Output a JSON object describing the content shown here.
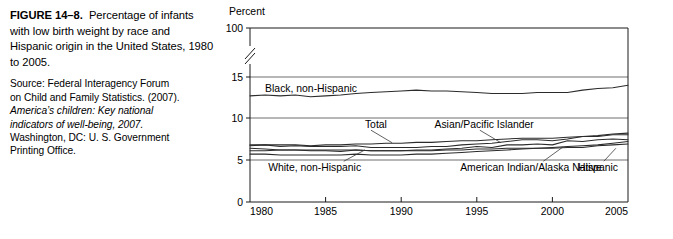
{
  "caption": {
    "figure_label": "FIGURE 14–8.",
    "title_text": "Percentage of infants with low birth weight by race and Hispanic origin in the United States, 1980 to 2005.",
    "source_line1": "Source: Federal Interagency Forum",
    "source_line2": "on Child and  Family Statistics. (2007).",
    "source_italic1": "America’s children: Key national",
    "source_italic2": "indicators of well-being, 2007.",
    "source_line3": "Washington, DC: U. S. Government",
    "source_line4": "Printing Office."
  },
  "chart_data": {
    "type": "line",
    "title": "",
    "xlabel": "",
    "ylabel": "Percent",
    "xlim": [
      1980,
      2005
    ],
    "ylim": [
      0,
      100
    ],
    "y_axis_break": {
      "between": [
        15,
        100
      ],
      "marker": "double-slash"
    },
    "grid": true,
    "legend": "inline-labels",
    "x_ticks": [
      1980,
      1985,
      1990,
      1995,
      2000,
      2005
    ],
    "x_tick_labels": [
      "1980",
      "1985",
      "1990",
      "1995",
      "2000",
      "2005"
    ],
    "y_ticks": [
      0,
      5,
      10,
      15,
      100
    ],
    "y_tick_labels": [
      "0",
      "5",
      "10",
      "15",
      "100"
    ],
    "x": [
      1980,
      1981,
      1982,
      1983,
      1984,
      1985,
      1986,
      1987,
      1988,
      1989,
      1990,
      1991,
      1992,
      1993,
      1994,
      1995,
      1996,
      1997,
      1998,
      1999,
      2000,
      2001,
      2002,
      2003,
      2004,
      2005
    ],
    "series": [
      {
        "name": "Black, non-Hispanic",
        "label": "Black, non-Hispanic",
        "label_x": 1981.0,
        "label_y": 13.6,
        "values": [
          12.7,
          12.8,
          12.7,
          12.8,
          12.6,
          12.7,
          12.8,
          13.0,
          13.1,
          13.2,
          13.3,
          13.4,
          13.3,
          13.3,
          13.2,
          13.1,
          13.0,
          13.0,
          13.0,
          13.1,
          13.1,
          13.1,
          13.4,
          13.6,
          13.7,
          14.0
        ]
      },
      {
        "name": "Total",
        "label": "Total",
        "label_x": 1987.6,
        "label_y": 9.2,
        "leader": {
          "x1": 1988.0,
          "y1": 8.55,
          "x2": 1989.4,
          "y2": 7.05
        },
        "values": [
          6.8,
          6.8,
          6.8,
          6.8,
          6.7,
          6.8,
          6.8,
          6.9,
          6.9,
          7.0,
          7.0,
          7.1,
          7.1,
          7.2,
          7.3,
          7.3,
          7.4,
          7.5,
          7.6,
          7.6,
          7.6,
          7.7,
          7.8,
          7.9,
          8.1,
          8.2
        ]
      },
      {
        "name": "Asian/Pacific Islander",
        "label": "Asian/Pacific Islander",
        "label_x": 1992.2,
        "label_y": 9.2,
        "leader": {
          "x1": 1995.2,
          "y1": 8.55,
          "x2": 1996.6,
          "y2": 7.05
        },
        "values": [
          6.7,
          6.8,
          6.6,
          6.7,
          6.6,
          6.6,
          6.6,
          6.7,
          6.5,
          6.5,
          6.5,
          6.5,
          6.6,
          6.6,
          6.8,
          6.9,
          7.0,
          7.2,
          7.4,
          7.4,
          7.3,
          7.5,
          7.8,
          7.8,
          8.0,
          8.0
        ]
      },
      {
        "name": "American Indian/Alaska Native",
        "label": "American Indian/Alaska Native",
        "label_x": 1993.9,
        "label_y": 4.15,
        "leader": {
          "x1": 1999.4,
          "y1": 4.85,
          "x2": 2000.7,
          "y2": 6.55
        },
        "values": [
          6.4,
          6.3,
          6.2,
          6.2,
          6.1,
          6.1,
          6.0,
          6.2,
          6.1,
          6.1,
          6.1,
          6.2,
          6.2,
          6.3,
          6.4,
          6.6,
          6.5,
          6.8,
          6.8,
          6.9,
          6.8,
          7.3,
          7.2,
          7.4,
          7.5,
          7.4
        ]
      },
      {
        "name": "Hispanic",
        "label": "Hispanic",
        "label_x": 2001.7,
        "label_y": 4.15,
        "leader": {
          "x1": 2003.4,
          "y1": 4.85,
          "x2": 2004.2,
          "y2": 6.4
        },
        "values": [
          6.1,
          6.1,
          6.2,
          6.2,
          6.2,
          6.2,
          6.2,
          6.2,
          6.1,
          6.1,
          6.1,
          6.1,
          6.1,
          6.2,
          6.2,
          6.3,
          6.3,
          6.4,
          6.4,
          6.4,
          6.4,
          6.5,
          6.5,
          6.7,
          6.8,
          6.9
        ]
      },
      {
        "name": "White, non-Hispanic",
        "label": "White, non-Hispanic",
        "label_x": 1981.2,
        "label_y": 4.15,
        "leader": {
          "x1": 1986.2,
          "y1": 4.85,
          "x2": 1987.6,
          "y2": 6.2
        },
        "values": [
          5.7,
          5.7,
          5.6,
          5.6,
          5.6,
          5.6,
          5.6,
          5.7,
          5.6,
          5.6,
          5.6,
          5.7,
          5.7,
          5.8,
          5.9,
          6.0,
          6.1,
          6.2,
          6.3,
          6.4,
          6.5,
          6.6,
          6.7,
          6.8,
          7.0,
          7.2
        ]
      }
    ]
  }
}
